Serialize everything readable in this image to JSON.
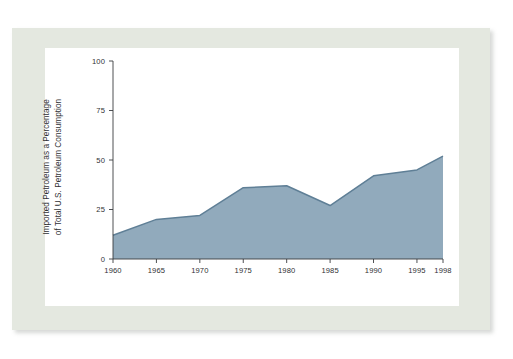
{
  "figure": {
    "mat_color": "#e4e8e0",
    "panel_color": "#ffffff",
    "top_text_remnant": "· ·   ·        ·     ···  ·    ·",
    "accent_fill": "#91aabc",
    "accent_line": "#5f7f96",
    "axis_color": "#3a3c40",
    "text_color": "#2f3134"
  },
  "chart_data": {
    "type": "area",
    "title": "",
    "subtitle": "",
    "xlabel": "",
    "ylabel": "Imported Petroleum as a Percentage of Total U.S. Petroleum Consumption",
    "ylabel_lines": [
      "Imported Petroleum as a Percentage",
      "of Total U.S. Petroleum Consumption"
    ],
    "x": [
      1960,
      1965,
      1970,
      1975,
      1980,
      1985,
      1990,
      1995,
      1998
    ],
    "categories": [
      "1960",
      "1965",
      "1970",
      "1975",
      "1980",
      "1985",
      "1990",
      "1995",
      "1998"
    ],
    "values": [
      12,
      20,
      22,
      36,
      37,
      27,
      42,
      45,
      52
    ],
    "series": [
      {
        "name": "Imported petroleum share",
        "values": [
          12,
          20,
          22,
          36,
          37,
          27,
          42,
          45,
          52
        ]
      }
    ],
    "xlim": [
      1960,
      1998
    ],
    "ylim": [
      0,
      100
    ],
    "ytick_labels": [
      "0",
      "25",
      "50",
      "75",
      "100"
    ],
    "yticks": [
      0,
      25,
      50,
      75,
      100
    ],
    "xtick_labels": [
      "1960",
      "1965",
      "1970",
      "1975",
      "1980",
      "1985",
      "1990",
      "1995",
      "1998"
    ],
    "xticks": [
      1960,
      1965,
      1970,
      1975,
      1980,
      1985,
      1990,
      1995,
      1998
    ],
    "grid": false,
    "legend": false,
    "legend_position": "none",
    "annotations": [],
    "fill_color": "#91aabc",
    "line_color": "#5f7f96"
  }
}
